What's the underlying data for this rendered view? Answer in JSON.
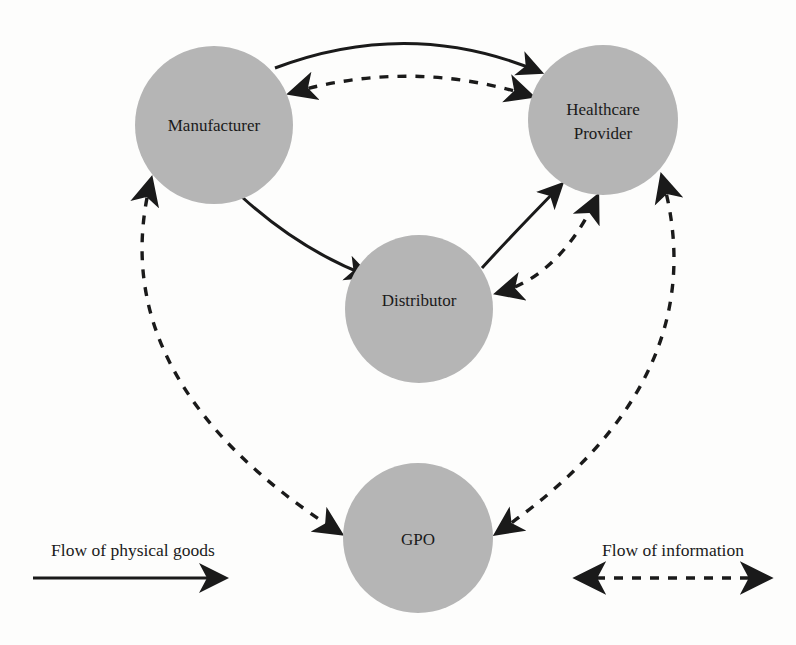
{
  "diagram": {
    "background_color": "#fdfdfc",
    "node_fill_color": "#b5b5b5",
    "line_color": "#1a1a1a",
    "nodes": [
      {
        "id": "manufacturer",
        "label": "Manufacturer",
        "label_lines": [
          "Manufacturer"
        ],
        "cx": 214,
        "cy": 125,
        "r": 79
      },
      {
        "id": "healthcare_provider",
        "label": "Healthcare Provider",
        "label_lines": [
          "Healthcare",
          "Provider"
        ],
        "cx": 603,
        "cy": 120,
        "r": 75
      },
      {
        "id": "distributor",
        "label": "Distributor",
        "label_lines": [
          "Distributor"
        ],
        "cx": 419,
        "cy": 309,
        "r": 74
      },
      {
        "id": "gpo",
        "label": "GPO",
        "label_lines": [
          "GPO"
        ],
        "cx": 418,
        "cy": 538,
        "r": 75
      }
    ],
    "edges": [
      {
        "id": "manufacturer-to-provider-goods",
        "from": "manufacturer",
        "to": "healthcare_provider",
        "style": "solid",
        "arrows": "single",
        "flow": "Flow of physical goods"
      },
      {
        "id": "manufacturer-to-distributor-goods",
        "from": "manufacturer",
        "to": "distributor",
        "style": "solid",
        "arrows": "single",
        "flow": "Flow of physical goods"
      },
      {
        "id": "distributor-to-provider-goods",
        "from": "distributor",
        "to": "healthcare_provider",
        "style": "solid",
        "arrows": "single",
        "flow": "Flow of physical goods"
      },
      {
        "id": "manufacturer-provider-information",
        "from": "manufacturer",
        "to": "healthcare_provider",
        "style": "dashed",
        "arrows": "double",
        "flow": "Flow of information"
      },
      {
        "id": "distributor-provider-information",
        "from": "distributor",
        "to": "healthcare_provider",
        "style": "dashed",
        "arrows": "double",
        "flow": "Flow of information"
      },
      {
        "id": "manufacturer-gpo-information",
        "from": "manufacturer",
        "to": "gpo",
        "style": "dashed",
        "arrows": "double",
        "flow": "Flow of information"
      },
      {
        "id": "provider-gpo-information",
        "from": "healthcare_provider",
        "to": "gpo",
        "style": "dashed",
        "arrows": "double",
        "flow": "Flow of information"
      }
    ]
  },
  "legend": {
    "goods": {
      "label": "Flow of physical goods",
      "style": "solid",
      "arrows": "single"
    },
    "information": {
      "label": "Flow of information",
      "style": "dashed",
      "arrows": "double"
    }
  }
}
